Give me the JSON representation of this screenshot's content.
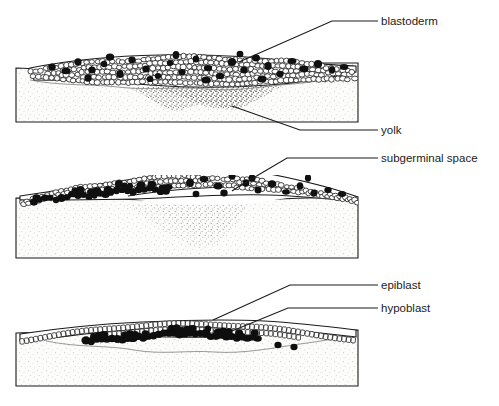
{
  "figure": {
    "type": "scientific-diagram",
    "background_color": "#ffffff",
    "line_color": "#1b1b1b",
    "yolk_fill": "#fbfbfa",
    "cell_fill": "#ffffff",
    "dark_cell_fill": "#111111"
  },
  "labels": [
    {
      "id": "blastoderm",
      "text": "blastoderm",
      "x": 381,
      "y": 25
    },
    {
      "id": "yolk",
      "text": "yolk",
      "x": 381,
      "y": 134
    },
    {
      "id": "subgerminal-space",
      "text": "subgerminal space",
      "x": 381,
      "y": 162
    },
    {
      "id": "epiblast",
      "text": "epiblast",
      "x": 381,
      "y": 289
    },
    {
      "id": "hypoblast",
      "text": "hypoblast",
      "x": 381,
      "y": 312
    }
  ],
  "leaders": [
    {
      "id": "leader-blastoderm",
      "points": "378,21 332,21 239,62"
    },
    {
      "id": "leader-yolk",
      "points": "378,130 300,130 232,106"
    },
    {
      "id": "leader-subgerminal-space",
      "points": "378,158 287,158 238,187 232,191"
    },
    {
      "id": "leader-epiblast",
      "points": "378,285 290,285 213,320"
    },
    {
      "id": "leader-hypoblast",
      "points": "378,308 288,308 232,331"
    }
  ],
  "panels": [
    {
      "id": "panel-1",
      "stage": "Blastoderm — multilayered cell mass on yolk",
      "block": {
        "x": 16,
        "y": 63,
        "w": 342,
        "h": 59
      },
      "features": [
        "blastoderm",
        "yolk",
        "dark-stippled-wedge"
      ]
    },
    {
      "id": "panel-2",
      "stage": "Subgerminal space forms beneath blastoderm",
      "block": {
        "x": 16,
        "y": 197,
        "w": 342,
        "h": 61
      },
      "features": [
        "blastoderm",
        "yolk",
        "subgerminal-space",
        "pale-stippled-wedge"
      ]
    },
    {
      "id": "panel-3",
      "stage": "Epiblast and hypoblast separate into two layers",
      "block": {
        "x": 16,
        "y": 330,
        "w": 342,
        "h": 56
      },
      "features": [
        "epiblast",
        "hypoblast",
        "yolk"
      ]
    }
  ]
}
